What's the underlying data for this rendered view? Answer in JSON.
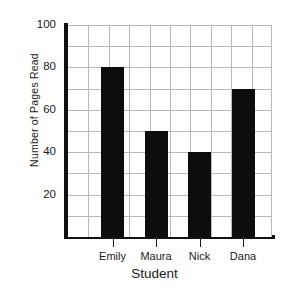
{
  "chart_data": {
    "type": "bar",
    "title": "",
    "categories": [
      "Emily",
      "Maura",
      "Nick",
      "Dana"
    ],
    "values": [
      80,
      50,
      40,
      70
    ],
    "xlabel": "Student",
    "ylabel": "Number of Pages Read",
    "ylim": [
      0,
      100
    ],
    "ytick_labels": [
      "20",
      "40",
      "60",
      "80",
      "100"
    ],
    "ytick_values": [
      20,
      40,
      60,
      80,
      100
    ],
    "ygrid_step": 10,
    "xgrid_columns": 10,
    "grid": true,
    "legend": "none",
    "bar_color": "#0d0d0d",
    "grid_color": "#b9b9b9",
    "axis_color": "#111111",
    "background": "#ffffff"
  }
}
